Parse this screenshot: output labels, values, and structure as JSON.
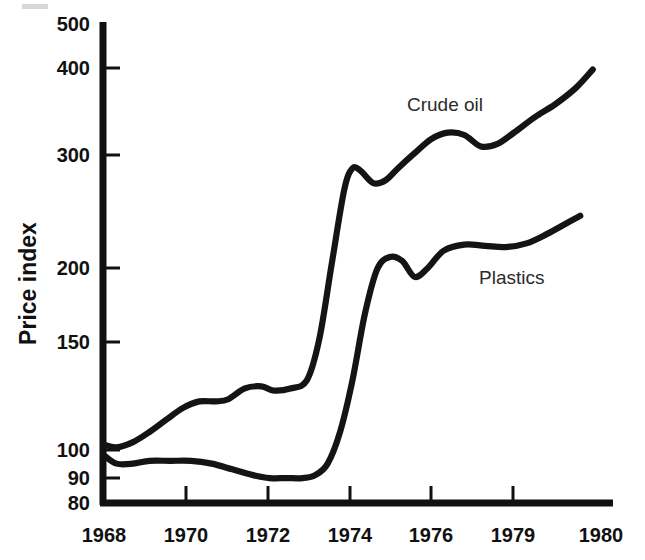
{
  "chart_data": {
    "type": "line",
    "title": "",
    "subtitle": "",
    "xlabel": "",
    "ylabel": "Price index",
    "yscale": "log",
    "ylim": [
      80,
      500
    ],
    "xlim": [
      1968,
      1980
    ],
    "grid": false,
    "legend_position": "inline-annotation",
    "ytick_labels": [
      "500",
      "400",
      "300",
      "200",
      "150",
      "100",
      "90",
      "80"
    ],
    "ytick_values": [
      500,
      400,
      300,
      200,
      150,
      100,
      90,
      80
    ],
    "xtick_labels": [
      "1968",
      "1970",
      "1972",
      "1974",
      "1976",
      "1979",
      "1980"
    ],
    "xtick_values": [
      1968,
      1970,
      1972,
      1974,
      1976,
      1979,
      1980
    ],
    "series": [
      {
        "name": "Crude oil",
        "color": "#141414",
        "x": [
          1968.0,
          1968.3,
          1968.7,
          1969.1,
          1969.5,
          1969.9,
          1970.3,
          1970.7,
          1971.0,
          1971.4,
          1971.8,
          1972.1,
          1972.5,
          1972.9,
          1973.2,
          1973.5,
          1973.8,
          1974.0,
          1974.2,
          1974.5,
          1974.8,
          1975.1,
          1975.5,
          1975.9,
          1976.3,
          1976.7,
          1977.1,
          1977.5,
          1977.9,
          1978.4,
          1978.9,
          1979.4,
          1979.8
        ],
        "y": [
          100,
          99,
          101,
          105,
          110,
          115,
          118,
          118,
          119,
          124,
          125,
          123,
          124,
          128,
          150,
          200,
          265,
          288,
          285,
          272,
          275,
          288,
          305,
          322,
          330,
          327,
          313,
          316,
          330,
          350,
          368,
          392,
          420
        ]
      },
      {
        "name": "Plastics",
        "color": "#141414",
        "x": [
          1968.0,
          1968.3,
          1968.7,
          1969.1,
          1969.6,
          1970.1,
          1970.6,
          1971.1,
          1971.6,
          1972.0,
          1972.4,
          1972.8,
          1973.1,
          1973.4,
          1973.7,
          1974.0,
          1974.3,
          1974.6,
          1974.9,
          1975.2,
          1975.5,
          1975.8,
          1976.2,
          1976.7,
          1977.2,
          1977.7,
          1978.2,
          1978.7,
          1979.2,
          1979.5
        ],
        "y": [
          96,
          93,
          93,
          94,
          94,
          94,
          93,
          91,
          89,
          88,
          88,
          88,
          89,
          93,
          105,
          128,
          165,
          196,
          205,
          202,
          190,
          196,
          210,
          215,
          214,
          213,
          216,
          224,
          234,
          240
        ]
      }
    ],
    "annotations": [
      {
        "text": "Crude oil",
        "x": 1975.0,
        "y": 360
      },
      {
        "text": "Plastics",
        "x": 1976.6,
        "y": 175
      }
    ]
  },
  "axis": {
    "y_title": "Price index",
    "y_ticks": [
      {
        "label": "500",
        "top": 14
      },
      {
        "label": "400",
        "top": 58
      },
      {
        "label": "300",
        "top": 145
      },
      {
        "label": "200",
        "top": 258
      },
      {
        "label": "150",
        "top": 332
      },
      {
        "label": "100",
        "top": 440
      },
      {
        "label": "90",
        "top": 468
      },
      {
        "label": "80",
        "top": 493
      }
    ],
    "x_ticks": [
      {
        "label": "1968",
        "left": 104
      },
      {
        "label": "1970",
        "left": 186
      },
      {
        "label": "1972",
        "left": 268
      },
      {
        "label": "1974",
        "left": 350
      },
      {
        "label": "1976",
        "left": 431
      },
      {
        "label": "1979",
        "left": 513
      },
      {
        "label": "1980",
        "left": 601
      }
    ]
  },
  "series_labels": {
    "crude_oil": "Crude oil",
    "plastics": "Plastics"
  }
}
